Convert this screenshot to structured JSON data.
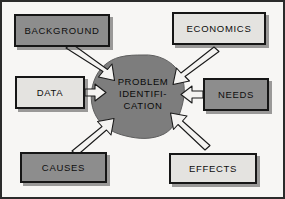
{
  "diagram": {
    "center": {
      "name": "problem-identification",
      "line1": "PROBLEM",
      "line2": "IDENTIFI-",
      "line3": "CATION",
      "fill": "#7d7d7d"
    },
    "nodes": [
      {
        "id": "background",
        "label": "BACKGROUND",
        "fill": "#8d8d8d",
        "shade": "dark",
        "position": "top-left"
      },
      {
        "id": "economics",
        "label": "ECONOMICS",
        "fill": "#e4e3e0",
        "shade": "light",
        "position": "top-right"
      },
      {
        "id": "data",
        "label": "DATA",
        "fill": "#e4e3e0",
        "shade": "light",
        "position": "middle-left"
      },
      {
        "id": "needs",
        "label": "NEEDS",
        "fill": "#8d8d8d",
        "shade": "dark",
        "position": "middle-right"
      },
      {
        "id": "causes",
        "label": "CAUSES",
        "fill": "#8d8d8d",
        "shade": "dark",
        "position": "bottom-left"
      },
      {
        "id": "effects",
        "label": "EFFECTS",
        "fill": "#e4e3e0",
        "shade": "light",
        "position": "bottom-right"
      }
    ],
    "arrows": [
      {
        "from": "background",
        "to": "problem-identification",
        "direction": "down-right"
      },
      {
        "from": "economics",
        "to": "problem-identification",
        "direction": "down-left"
      },
      {
        "from": "data",
        "to": "problem-identification",
        "direction": "right"
      },
      {
        "from": "needs",
        "to": "problem-identification",
        "direction": "left"
      },
      {
        "from": "causes",
        "to": "problem-identification",
        "direction": "up-right"
      },
      {
        "from": "effects",
        "to": "problem-identification",
        "direction": "up-left"
      }
    ],
    "colors": {
      "background": "#f7f6f4",
      "frame": "#2b2b2b",
      "outline": "#161616",
      "blob": "#7d7d7d",
      "text": "#0d0d0d"
    }
  }
}
